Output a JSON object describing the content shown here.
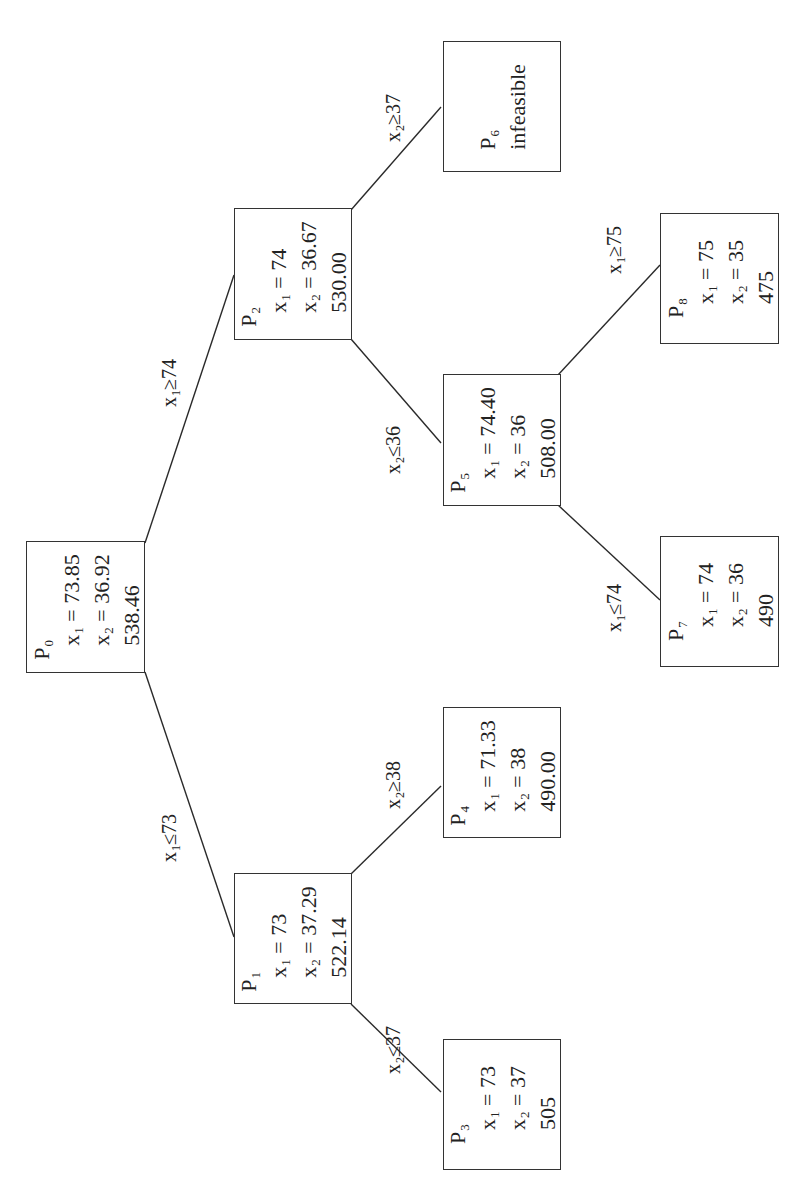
{
  "diagram": {
    "type": "branch-and-bound-tree",
    "nodes": [
      {
        "id": "P0",
        "name": "P",
        "sub": "0",
        "x1": "73.85",
        "x2": "36.92",
        "z": "538.46"
      },
      {
        "id": "P1",
        "name": "P",
        "sub": "1",
        "x1": "73",
        "x2": "37.29",
        "z": "522.14"
      },
      {
        "id": "P2",
        "name": "P",
        "sub": "2",
        "x1": "74",
        "x2": "36.67",
        "z": "530.00"
      },
      {
        "id": "P3",
        "name": "P",
        "sub": "3",
        "x1": "73",
        "x2": "37",
        "z": "505"
      },
      {
        "id": "P4",
        "name": "P",
        "sub": "4",
        "x1": "71.33",
        "x2": "38",
        "z": "490.00"
      },
      {
        "id": "P5",
        "name": "P",
        "sub": "5",
        "x1": "74.40",
        "x2": "36",
        "z": "508.00"
      },
      {
        "id": "P6",
        "name": "P",
        "sub": "6",
        "status": "infeasible"
      },
      {
        "id": "P7",
        "name": "P",
        "sub": "7",
        "x1": "74",
        "x2": "36",
        "z": "490"
      },
      {
        "id": "P8",
        "name": "P",
        "sub": "8",
        "x1": "75",
        "x2": "35",
        "z": "475"
      }
    ],
    "edges": [
      {
        "from": "P0",
        "to": "P1",
        "var": "x",
        "sub": "1",
        "op": "≤",
        "val": "73"
      },
      {
        "from": "P0",
        "to": "P2",
        "var": "x",
        "sub": "1",
        "op": "≥",
        "val": "74"
      },
      {
        "from": "P1",
        "to": "P3",
        "var": "x",
        "sub": "2",
        "op": "≤",
        "val": "37"
      },
      {
        "from": "P1",
        "to": "P4",
        "var": "x",
        "sub": "2",
        "op": "≥",
        "val": "38"
      },
      {
        "from": "P2",
        "to": "P5",
        "var": "x",
        "sub": "2",
        "op": "≤",
        "val": "36"
      },
      {
        "from": "P2",
        "to": "P6",
        "var": "x",
        "sub": "2",
        "op": "≥",
        "val": "37"
      },
      {
        "from": "P5",
        "to": "P7",
        "var": "x",
        "sub": "1",
        "op": "≤",
        "val": "74"
      },
      {
        "from": "P5",
        "to": "P8",
        "var": "x",
        "sub": "1",
        "op": "≥",
        "val": "75"
      }
    ],
    "labels": {
      "eq": " = ",
      "x": "x",
      "one": "1",
      "two": "2"
    }
  }
}
